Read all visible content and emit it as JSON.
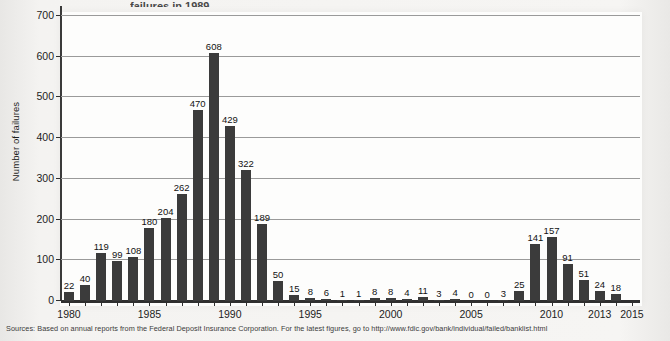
{
  "page": {
    "title_fragment": "failures in 1989",
    "source_note": "Sources: Based on annual reports from the Federal Deposit Insurance Corporation. For the latest figures, go to http://www.fdic.gov/bank/individual/failed/banklist.html"
  },
  "colors": {
    "bar": "#3b3b3b",
    "grid": "#9a9a9a",
    "axis": "#2f2f2f",
    "plot_background": "#fdfdfc",
    "page_background": "#f2f1ef"
  },
  "chart_data": {
    "type": "bar",
    "title": "",
    "xlabel": "",
    "ylabel": "Number of failures",
    "ylim": [
      0,
      700
    ],
    "yticks": [
      0,
      100,
      200,
      300,
      400,
      500,
      600,
      700
    ],
    "xticks": [
      1980,
      1985,
      1990,
      1995,
      2000,
      2005,
      2010,
      2013,
      2015
    ],
    "xlim": [
      1979.5,
      2015.5
    ],
    "grid": true,
    "legend": "none",
    "categories": [
      1980,
      1981,
      1982,
      1983,
      1984,
      1985,
      1986,
      1987,
      1988,
      1989,
      1990,
      1991,
      1992,
      1993,
      1994,
      1995,
      1996,
      1997,
      1998,
      1999,
      2000,
      2001,
      2002,
      2003,
      2004,
      2005,
      2006,
      2007,
      2008,
      2009,
      2010,
      2011,
      2012,
      2013,
      2014
    ],
    "values": [
      22,
      40,
      119,
      99,
      108,
      180,
      204,
      262,
      470,
      608,
      429,
      322,
      189,
      50,
      15,
      8,
      6,
      1,
      1,
      8,
      8,
      4,
      11,
      3,
      4,
      0,
      0,
      3,
      25,
      141,
      157,
      91,
      51,
      24,
      18
    ],
    "value_labels": [
      "22",
      "40",
      "119",
      "99",
      "108",
      "180",
      "204",
      "262",
      "470",
      "608",
      "429",
      "322",
      "189",
      "50",
      "15",
      "8",
      "6",
      "1",
      "1",
      "8",
      "8",
      "4",
      "11",
      "3",
      "4",
      "0",
      "0",
      "3",
      "25",
      "141",
      "157",
      "91",
      "51",
      "24",
      "18"
    ]
  }
}
